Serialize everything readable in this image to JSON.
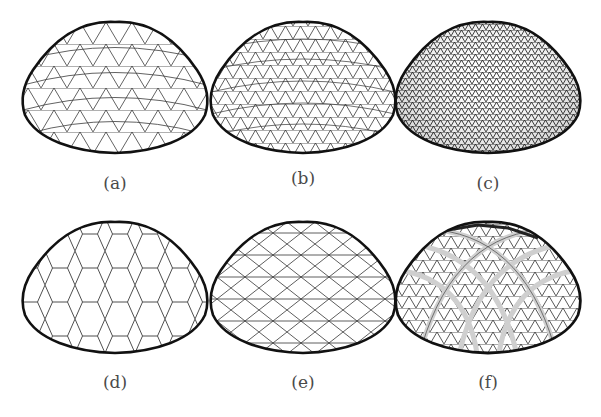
{
  "figure": {
    "background": "#ffffff",
    "outline_color": "#111111",
    "grid_color": "#3a3a3a",
    "panels": [
      {
        "id": "a",
        "label": "(a)",
        "description": "coarse triangular grid dome"
      },
      {
        "id": "b",
        "label": "(b)",
        "description": "medium triangular grid dome"
      },
      {
        "id": "c",
        "label": "(c)",
        "description": "fine triangular grid dome"
      },
      {
        "id": "d",
        "label": "(d)",
        "description": "hexagonal grid dome"
      },
      {
        "id": "e",
        "label": "(e)",
        "description": "diamond / lamella grid dome"
      },
      {
        "id": "f",
        "label": "(f)",
        "description": "triangular grid dome with arched ribs"
      }
    ]
  }
}
